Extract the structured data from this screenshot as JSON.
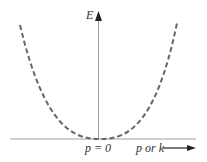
{
  "diagram": {
    "y_axis_label": "E",
    "origin_label": "p = 0",
    "x_axis_label": "p or k",
    "curve_style": "dashed parabola",
    "colors": {
      "axis": "#777777",
      "curve": "#666666",
      "text": "#333333",
      "arrow": "#222222"
    }
  }
}
